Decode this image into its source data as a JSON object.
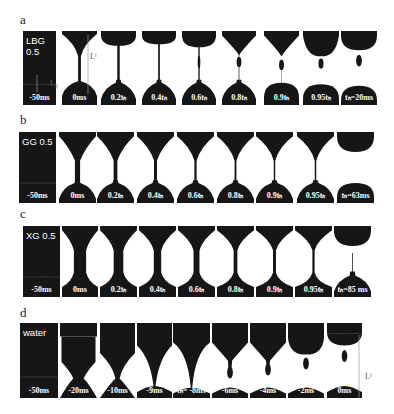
{
  "figure": {
    "rows": [
      {
        "label": "a",
        "fluid": "LBG 0.5",
        "panels": [
          "-50ms",
          "0ms",
          "0.2tₕ",
          "0.4tₕ",
          "0.6tₕ",
          "0.8tₕ",
          "0.9tₕ",
          "0.95tₕ",
          "tₕ=20ms"
        ],
        "annotations": {
          "Lf": "Lᶠ",
          "L0": "L₀"
        }
      },
      {
        "label": "b",
        "fluid": "GG 0.5",
        "panels": [
          "-50ms",
          "0ms",
          "0.2tₕ",
          "0.4tₕ",
          "0.6tₕ",
          "0.8tₕ",
          "0.9tₕ",
          "0.95tₕ",
          "tₕ=63ms"
        ]
      },
      {
        "label": "c",
        "fluid": "XG 0.5",
        "panels": [
          "-50ms",
          "0ms",
          "0.2tₕ",
          "0.4tₕ",
          "0.6tₕ",
          "0.8tₕ",
          "0.9tₕ",
          "0.95tₕ",
          "tₕ=85 ms"
        ]
      },
      {
        "label": "d",
        "fluid": "water",
        "panels": [
          "-50ms",
          "-20ms",
          "-10ms",
          "-9ms",
          "tₕ= -8ms",
          "-6ms",
          "-4ms",
          "-2ms",
          "0ms"
        ],
        "annotations": {
          "Lf": "Lᶠ"
        }
      }
    ]
  }
}
